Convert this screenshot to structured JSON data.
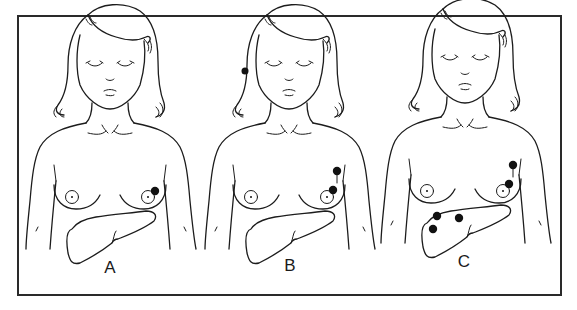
{
  "figure": {
    "type": "medical-illustration",
    "colors": {
      "line": "#1c1c1c",
      "lesion": "#111111",
      "background": "#ffffff"
    },
    "panels": [
      {
        "label": "A",
        "lesions": {
          "breast": 1,
          "axillary_nodes": 0,
          "liver": 0
        }
      },
      {
        "label": "B",
        "lesions": {
          "breast": 1,
          "axillary_nodes": 1,
          "liver": 0
        }
      },
      {
        "label": "C",
        "lesions": {
          "breast": 1,
          "axillary_nodes": 1,
          "liver": 3
        }
      }
    ]
  }
}
